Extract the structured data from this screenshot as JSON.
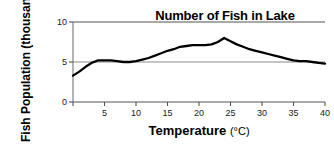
{
  "chart_data": {
    "type": "line",
    "title": "Number of Fish in Lake",
    "xlabel": "Temperature",
    "xunit": "(°C)",
    "ylabel_line1": "Fish",
    "ylabel_line2": "Population",
    "ylabel_line3": "(thousands)",
    "ylabel": "Fish Population (thousands)",
    "xlim": [
      0,
      40
    ],
    "ylim": [
      0,
      10
    ],
    "xticks": [
      0,
      5,
      10,
      15,
      20,
      25,
      30,
      35,
      40
    ],
    "xtick_labels": [
      "",
      "5",
      "10",
      "15",
      "20",
      "25",
      "30",
      "35",
      "40"
    ],
    "yticks": [
      0,
      5,
      10
    ],
    "ytick_labels": [
      "0",
      "5",
      "10"
    ],
    "grid": "horizontal-gridlines-at-0-5-10",
    "legend": "none",
    "line_color": "#000000",
    "grid_color": "#8c8c8c",
    "series": [
      {
        "name": "Fish population",
        "x": [
          0,
          1,
          2,
          3,
          4,
          5,
          6,
          7,
          8,
          9,
          10,
          11,
          12,
          13,
          14,
          15,
          16,
          17,
          18,
          19,
          20,
          21,
          22,
          23,
          24,
          25,
          26,
          27,
          28,
          29,
          30,
          31,
          32,
          33,
          34,
          35,
          36,
          37,
          38,
          39,
          40
        ],
        "values": [
          3.3,
          3.8,
          4.4,
          4.9,
          5.2,
          5.2,
          5.2,
          5.1,
          5.0,
          5.0,
          5.1,
          5.3,
          5.5,
          5.8,
          6.1,
          6.4,
          6.6,
          6.9,
          7.0,
          7.1,
          7.1,
          7.1,
          7.2,
          7.5,
          8.0,
          7.6,
          7.2,
          6.9,
          6.6,
          6.4,
          6.2,
          6.0,
          5.8,
          5.6,
          5.4,
          5.2,
          5.1,
          5.1,
          5.0,
          4.9,
          4.8
        ]
      }
    ]
  }
}
